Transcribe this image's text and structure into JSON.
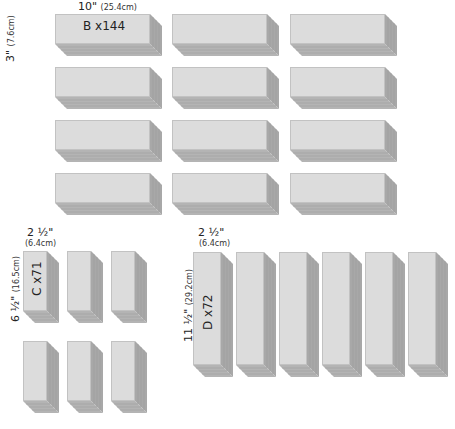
{
  "diagram": {
    "colors": {
      "face": "#dcdcdc",
      "side": "#a8a8a8",
      "bottom": "#b4b4b4",
      "edge": "#c2c2c2"
    },
    "groups": [
      {
        "id": "B",
        "label": "B x144",
        "width_label": "10\"",
        "width_metric": "(25.4cm)",
        "height_label": "3\"",
        "height_metric": "(7.6cm)",
        "stacks": 12,
        "quantity": 144
      },
      {
        "id": "C",
        "label": "C x71",
        "width_label": "2 ½\"",
        "width_metric": "(6.4cm)",
        "height_label": "6 ½\"",
        "height_metric": "(16.5cm)",
        "stacks": 6,
        "quantity": 71
      },
      {
        "id": "D",
        "label": "D x72",
        "width_label": "2 ½\"",
        "width_metric": "(6.4cm)",
        "height_label": "11 ½\"",
        "height_metric": "(29.2cm)",
        "stacks": 6,
        "quantity": 72
      }
    ]
  }
}
